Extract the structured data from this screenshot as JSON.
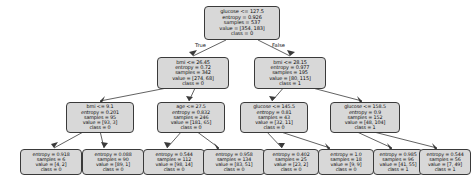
{
  "figure": {
    "type": "decision-tree-diagram",
    "background_color": "#ffffff",
    "node_fill_color": "#d8d8d8",
    "node_border_color": "#3a3a3a",
    "edge_color": "#3a3a3a"
  },
  "edge_labels": {
    "true": "True",
    "false": "False"
  },
  "nodes": [
    {
      "id": "root",
      "kind": "internal",
      "condition": "glucose <= 127.5",
      "entropy": "entropy = 0.926",
      "samples": "samples = 537",
      "value": "value = [354, 183]",
      "class": "class = 0"
    },
    {
      "id": "n-l",
      "kind": "internal",
      "condition": "bmi <= 26.45",
      "entropy": "entropy = 0.72",
      "samples": "samples = 342",
      "value": "value = [274, 68]",
      "class": "class = 0"
    },
    {
      "id": "n-r",
      "kind": "internal",
      "condition": "bmi <= 28.15",
      "entropy": "entropy = 0.977",
      "samples": "samples = 195",
      "value": "value = [80, 115]",
      "class": "class = 1"
    },
    {
      "id": "n-ll",
      "kind": "internal",
      "condition": "bmi <= 9.1",
      "entropy": "entropy = 0.201",
      "samples": "samples = 95",
      "value": "value = [93, 3]",
      "class": "class = 0"
    },
    {
      "id": "n-lr",
      "kind": "internal",
      "condition": "age <= 27.5",
      "entropy": "entropy = 0.832",
      "samples": "samples = 246",
      "value": "value = [181, 65]",
      "class": "class = 0"
    },
    {
      "id": "n-rl",
      "kind": "internal",
      "condition": "glucose <= 145.5",
      "entropy": "entropy = 0.81",
      "samples": "samples = 43",
      "value": "value = [32, 11]",
      "class": "class = 0"
    },
    {
      "id": "n-rr",
      "kind": "internal",
      "condition": "glucose <= 158.5",
      "entropy": "entropy = 0.9",
      "samples": "samples = 152",
      "value": "value = [48, 104]",
      "class": "class = 1"
    },
    {
      "id": "leaf-1",
      "kind": "leaf",
      "entropy": "entropy = 0.918",
      "samples": "samples = 6",
      "value": "value = [4, 2]",
      "class": "class = 0"
    },
    {
      "id": "leaf-2",
      "kind": "leaf",
      "entropy": "entropy = 0.088",
      "samples": "samples = 90",
      "value": "value = [89, 1]",
      "class": "class = 0"
    },
    {
      "id": "leaf-3",
      "kind": "leaf",
      "entropy": "entropy = 0.544",
      "samples": "samples = 112",
      "value": "value = [98, 14]",
      "class": "class = 0"
    },
    {
      "id": "leaf-4",
      "kind": "leaf",
      "entropy": "entropy = 0.958",
      "samples": "samples = 134",
      "value": "value = [83, 51]",
      "class": "class = 0"
    },
    {
      "id": "leaf-5",
      "kind": "leaf",
      "entropy": "entropy = 0.402",
      "samples": "samples = 25",
      "value": "value = [23, 2]",
      "class": "class = 0"
    },
    {
      "id": "leaf-6",
      "kind": "leaf",
      "entropy": "entropy = 1.0",
      "samples": "samples = 18",
      "value": "value = [9, 9]",
      "class": "class = 0"
    },
    {
      "id": "leaf-7",
      "kind": "leaf",
      "entropy": "entropy = 0.985",
      "samples": "samples = 96",
      "value": "value = [41, 55]",
      "class": "class = 1"
    },
    {
      "id": "leaf-8",
      "kind": "leaf",
      "entropy": "entropy = 0.544",
      "samples": "samples = 56",
      "value": "value = [7, 49]",
      "class": "class = 1"
    }
  ]
}
